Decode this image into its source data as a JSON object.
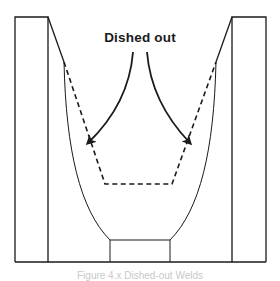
{
  "figure": {
    "annotation": "Dished out",
    "caption": "Figure 4.x  Dished-out Welds",
    "colors": {
      "line": "#1a1a1a",
      "background": "#ffffff",
      "caption": "#c8c8c8"
    }
  }
}
